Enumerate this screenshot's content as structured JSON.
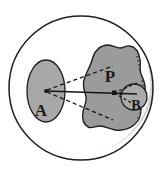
{
  "figure": {
    "background_color": "#ffffff",
    "outline_color": "#1f1f1f",
    "fill_gray": "#a8a8a8",
    "blob_gray": "#9b9b9b",
    "rim_shade_gray": "#c9c9c9",
    "line_color": "#141414"
  },
  "labels": {
    "a": "A",
    "p": "P",
    "b": "B"
  },
  "shapes": {
    "outer_circle": {
      "name": "outer-circle",
      "cx": 81,
      "cy": 88,
      "r": 72,
      "fill": "none",
      "stroke": "#1f1f1f"
    },
    "ellipse_a": {
      "name": "region-a",
      "cx": 46,
      "cy": 91,
      "rx": 19,
      "ry": 31,
      "fill": "#a8a8a8"
    },
    "blob_p": {
      "name": "region-p",
      "fill": "#9b9b9b",
      "approx_center_x": 112,
      "approx_center_y": 92
    },
    "circle_b": {
      "name": "region-b",
      "cx": 134,
      "cy": 97,
      "r": 13,
      "fill": "#a8a8a8"
    },
    "center_point_a": {
      "name": "apex-point-a",
      "cx": 46,
      "cy": 91
    },
    "center_point_p": {
      "name": "convergence-point-p",
      "cx": 114,
      "cy": 93
    }
  },
  "lines": {
    "solid_axis": {
      "name": "sight-axis-line",
      "x1": 46,
      "y1": 91,
      "x2": 136,
      "y2": 94,
      "style": "solid"
    },
    "cone_upper": {
      "name": "tangent-line-upper",
      "x1": 47,
      "y1": 90,
      "x2": 113,
      "y2": 66,
      "style": "dashed"
    },
    "cone_lower": {
      "name": "tangent-line-lower",
      "x1": 47,
      "y1": 92,
      "x2": 113,
      "y2": 120,
      "style": "dashed"
    },
    "inner_cone_upper": {
      "name": "inner-ray-upper",
      "x1": 114,
      "y1": 93,
      "x2": 136,
      "y2": 82,
      "style": "dashed"
    },
    "inner_cone_lower": {
      "name": "inner-ray-lower",
      "x1": 114,
      "y1": 93,
      "x2": 136,
      "y2": 106,
      "style": "dashed"
    }
  },
  "annotations": {
    "rim_hatching": "hatched-inner-rim",
    "shadow_arc": "lower-right-inner-shadow"
  }
}
